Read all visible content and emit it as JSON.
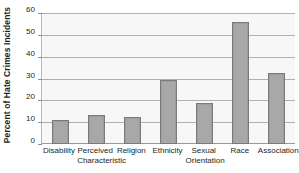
{
  "chart_data": {
    "type": "bar",
    "title": "",
    "subtitle": "",
    "xlabel": "",
    "ylabel": "Percent of Hate Crimes Incidents",
    "categories": [
      "Disability",
      "Perceived Characteristic",
      "Religion",
      "Ethnicity",
      "Sexual Orientation",
      "Race",
      "Association"
    ],
    "category_lines": [
      [
        "Disability"
      ],
      [
        "Perceived",
        "Characteristic"
      ],
      [
        "Religion"
      ],
      [
        "Ethnicity"
      ],
      [
        "Sexual",
        "Orientation"
      ],
      [
        "Race"
      ],
      [
        "Association"
      ]
    ],
    "values": [
      11,
      13.5,
      12.5,
      29.5,
      19,
      56,
      32.5
    ],
    "ylim": [
      0,
      60
    ],
    "ytick_values": [
      0,
      10,
      20,
      30,
      40,
      50,
      60
    ],
    "ytick_labels": [
      "0",
      "10",
      "20",
      "30",
      "40",
      "50",
      "60"
    ],
    "grid": true,
    "grid_axis": "y",
    "legend": false,
    "legend_position": "none",
    "bar_color": "#a8a8a8",
    "bar_edge_color": "#7a7a7a",
    "plot_background": "#f7f7f7",
    "gridline_color": "#b0b0b0",
    "axis_color": "#b9b9b9",
    "text_color": "#231f20"
  }
}
